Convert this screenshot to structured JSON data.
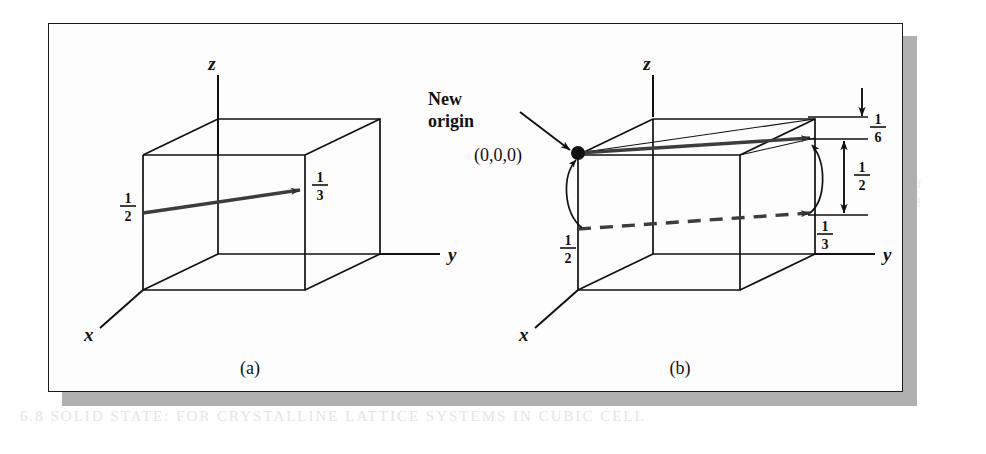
{
  "figure": {
    "background_color": "#ffffff",
    "frame_color": "#1a1a1a",
    "shadow_color": "#b0b0b0",
    "ink_color": "#111111",
    "panels": [
      {
        "id": "a",
        "caption": "(a)",
        "axis_labels": {
          "x": "x",
          "y": "y",
          "z": "z"
        },
        "vector_tail_label": "1/2",
        "vector_tail_numerator": "1",
        "vector_tail_denominator": "2",
        "vector_head_label": "1/3",
        "vector_head_numerator": "1",
        "vector_head_denominator": "3"
      },
      {
        "id": "b",
        "caption": "(b)",
        "axis_labels": {
          "x": "x",
          "y": "y",
          "z": "z"
        },
        "new_origin_label_line1": "New",
        "new_origin_label_line2": "origin",
        "origin_coords": "(0,0,0)",
        "left_label_numerator": "1",
        "left_label_denominator": "2",
        "lower_right_numerator": "1",
        "lower_right_denominator": "3",
        "dim_top_numerator": "1",
        "dim_top_denominator": "6",
        "dim_bottom_numerator": "1",
        "dim_bottom_denominator": "2"
      }
    ]
  },
  "ghost_text": {
    "lines": [
      "we the thermal and vertical components of",
      "obtaining the intersection in the combined",
      "intersects the coordinate of the line must"
    ],
    "bottom_line": "6.8 SOLID STATE: FOR CRYSTALLINE LATTICE SYSTEMS IN CUBIC CELL"
  }
}
